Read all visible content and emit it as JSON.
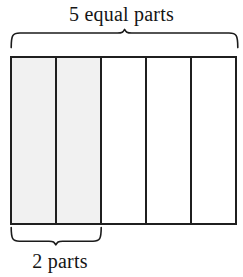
{
  "diagram": {
    "title_top": "5 equal parts",
    "title_bottom": "2 parts",
    "total_parts": 5,
    "shaded_parts": 2,
    "fraction": "2/5",
    "colors": {
      "stroke": "#1f1f1f",
      "shaded_fill": "#f1f1f1",
      "unshaded_fill": "#ffffff",
      "background": "#ffffff",
      "text": "#151515"
    },
    "top_brace": {
      "label": "5 equal parts",
      "spans_parts": 5,
      "direction": "up"
    },
    "bottom_brace": {
      "label": "2 parts",
      "spans_parts": 2,
      "direction": "down"
    },
    "cells": [
      {
        "index": 1,
        "shaded": true,
        "fill": "#f1f1f1"
      },
      {
        "index": 2,
        "shaded": true,
        "fill": "#f1f1f1"
      },
      {
        "index": 3,
        "shaded": false,
        "fill": "#ffffff"
      },
      {
        "index": 4,
        "shaded": false,
        "fill": "#ffffff"
      },
      {
        "index": 5,
        "shaded": false,
        "fill": "#ffffff"
      }
    ]
  }
}
